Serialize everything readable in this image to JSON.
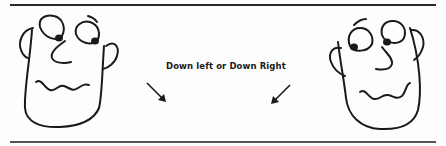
{
  "illustration": {
    "caption": "Down left or Down Right",
    "figures": [
      {
        "name": "left-face",
        "gaze": "down-right"
      },
      {
        "name": "right-face",
        "gaze": "down-left"
      }
    ],
    "arrows": [
      {
        "name": "arrow-down-right",
        "direction": "down-right"
      },
      {
        "name": "arrow-down-left",
        "direction": "down-left"
      }
    ],
    "colors": {
      "ink": "#1a1a1a",
      "paper": "#fdfdfd"
    }
  }
}
